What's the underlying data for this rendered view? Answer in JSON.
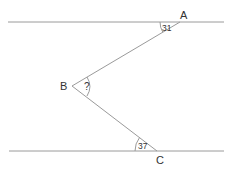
{
  "diagram": {
    "type": "geometry-parallel-lines-angle",
    "points": {
      "A": {
        "label": "A"
      },
      "B": {
        "label": "B"
      },
      "C": {
        "label": "C"
      }
    },
    "angles": {
      "at_A": "31",
      "at_B": "?",
      "at_C": "37"
    },
    "colors": {
      "line": "#9a9a9a",
      "text": "#333333"
    }
  }
}
